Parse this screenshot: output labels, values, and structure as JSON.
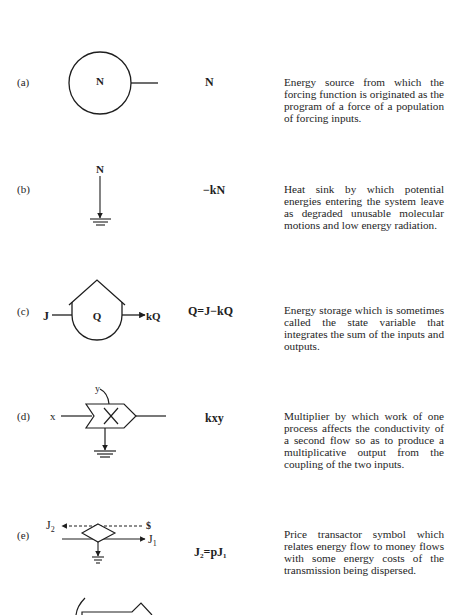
{
  "rows": [
    {
      "label": "(a)",
      "symbol_name": "energy-source",
      "symbol_text": "N",
      "equation": "N",
      "description": "Energy source from which the forcing function is originated as the program of a force of a population of forcing inputs."
    },
    {
      "label": "(b)",
      "symbol_name": "heat-sink",
      "symbol_text": "N",
      "equation": "−kN",
      "description": "Heat sink by which potential energies entering the system leave as degraded unusable molecular motions and low energy radiation."
    },
    {
      "label": "(c)",
      "symbol_name": "energy-storage",
      "symbol_input": "J",
      "symbol_text": "Q",
      "symbol_output": "kQ",
      "equation": "Q=J−kQ",
      "description": "Energy storage which is sometimes called the state variable that integrates the sum of the inputs and outputs."
    },
    {
      "label": "(d)",
      "symbol_name": "multiplier",
      "symbol_input_x": "x",
      "symbol_input_y": "y",
      "equation": "kxy",
      "description": "Multiplier by which work of one process affects the conductivity of a second flow so as to produce a multiplicative output from the coupling of the two inputs."
    },
    {
      "label": "(e)",
      "symbol_name": "price-transactor",
      "symbol_money": "$",
      "symbol_j2": "J",
      "symbol_j2_sub": "2",
      "symbol_j1": "J",
      "symbol_j1_sub": "1",
      "equation": "J₂=pJ₁",
      "description": "Price transactor symbol which relates energy flow to money flows with some energy costs of the transmission being dispersed."
    }
  ],
  "colors": {
    "ink": "#1e1e1e",
    "paper": "#ffffff"
  }
}
